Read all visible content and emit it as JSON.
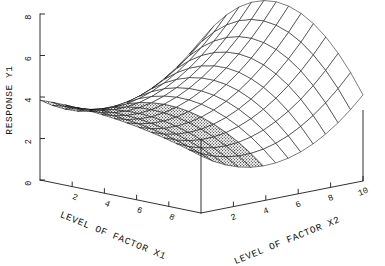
{
  "chart_data": {
    "type": "surface",
    "title": "",
    "subtitle": "",
    "zlabel": "RESPONSE Y1",
    "xlabel": "LEVEL OF FACTOR X1",
    "ylabel": "LEVEL OF FACTOR X2",
    "grid": false,
    "legend": "none",
    "projection": "3d-wireframe-saddle",
    "z_axis": {
      "label": "RESPONSE Y1",
      "ticks": [
        0,
        2,
        4,
        6,
        8
      ],
      "tick_labels": [
        "0",
        "2",
        "4",
        "6",
        "8"
      ],
      "range": [
        0,
        8
      ],
      "orientation": "vertical-left",
      "label_rotation_deg": -90
    },
    "x_axis": {
      "label": "LEVEL OF FACTOR X1",
      "ticks": [
        2,
        4,
        6,
        8
      ],
      "tick_labels": [
        "2",
        "4",
        "6",
        "8"
      ],
      "range": [
        0,
        10
      ],
      "orientation": "depth-left",
      "label_rotation_deg": 22
    },
    "y_axis": {
      "label": "LEVEL OF FACTOR X2",
      "ticks": [
        2,
        4,
        6,
        8,
        10
      ],
      "tick_labels": [
        "2",
        "4",
        "6",
        "8",
        "10"
      ],
      "range": [
        0,
        10
      ],
      "orientation": "depth-right",
      "label_rotation_deg": -22
    },
    "surface_description": "Saddle-shaped response surface with a shaded (stippled) left lobe rising to about Y1=5 and an open wireframe right lobe rising to about Y1=8, meeting at a central saddle point near Y1=4.",
    "features": [
      {
        "name": "left-lobe-peak",
        "x1": 2,
        "x2": 2,
        "y1": 5.0,
        "shaded": true
      },
      {
        "name": "saddle-point",
        "x1": 6,
        "x2": 5,
        "y1": 4.0,
        "shaded": false
      },
      {
        "name": "right-lobe-peak",
        "x1": 3,
        "x2": 9,
        "y1": 8.0,
        "shaded": false
      },
      {
        "name": "front-trough",
        "x1": 9,
        "x2": 6,
        "y1": 0.8,
        "shaded": false
      }
    ],
    "mesh": {
      "rows": 13,
      "cols": 13
    },
    "colors": {
      "line": "#111111",
      "axis": "#1a1a1a",
      "shaded_fill": "#b9b9b9",
      "plain_fill": "#ffffff",
      "background": "#ffffff"
    }
  }
}
